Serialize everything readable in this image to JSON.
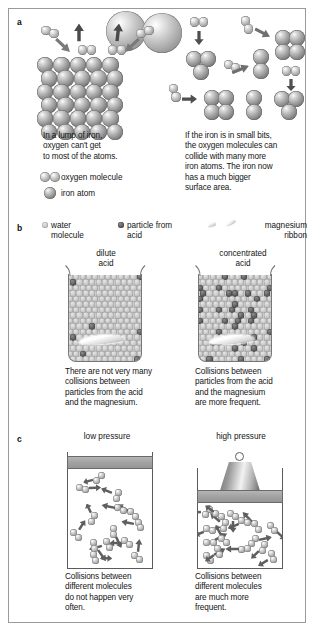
{
  "figure": {
    "background": "#ffffff",
    "border_color": "#9a9a9a"
  },
  "panels": [
    {
      "id": "a",
      "letter": "a",
      "topic": "surface area",
      "left": {
        "caption": "In a lump of iron, oxygen can't get to most of the atoms.",
        "caption_lines": [
          "In a lump of iron,",
          "oxygen can't get",
          "to most of the atoms."
        ]
      },
      "right": {
        "caption": "If the iron is in small bits, the oxygen molecules can collide with many more iron atoms. The iron now has a much bigger surface area.",
        "caption_lines": [
          "If the iron is in small bits,",
          "the oxygen molecules can",
          "collide with many more",
          "iron atoms. The iron now",
          "has a much bigger",
          "surface area."
        ]
      },
      "key": [
        {
          "swatch": "oxygen-molecule-icon",
          "label": "oxygen molecule"
        },
        {
          "swatch": "iron-atom-icon",
          "label": "iron atom"
        }
      ]
    },
    {
      "id": "b",
      "letter": "b",
      "topic": "concentration",
      "key": [
        {
          "swatch": "water-molecule-icon",
          "label_lines": [
            "water",
            "molecule"
          ],
          "label": "water molecule",
          "color": "#c6c6c6"
        },
        {
          "swatch": "acid-particle-icon",
          "label_lines": [
            "particle from",
            "acid"
          ],
          "label": "particle from acid",
          "color": "#4a4a4a"
        },
        {
          "swatch": "magnesium-ribbon-icon",
          "label_lines": [
            "magnesium",
            "ribbon"
          ],
          "label": "magnesium ribbon",
          "color": "#f0f0f0"
        }
      ],
      "left": {
        "heading_lines": [
          "dilute",
          "acid"
        ],
        "heading": "dilute acid",
        "caption": "There are not very many collisions between particles from the acid and the magnesium.",
        "caption_lines": [
          "There are not very many",
          "collisions between",
          "particles from the acid",
          "and the magnesium."
        ]
      },
      "right": {
        "heading_lines": [
          "concentrated",
          "acid"
        ],
        "heading": "concentrated acid",
        "caption": "Collisions between particles from the acid and the magnesium are more frequent.",
        "caption_lines": [
          "Collisions between",
          "particles from the acid",
          "and the magnesium",
          "are more frequent."
        ]
      }
    },
    {
      "id": "c",
      "letter": "c",
      "topic": "pressure",
      "left": {
        "heading": "low pressure",
        "caption": "Collisions between different molecules do not happen very often.",
        "caption_lines": [
          "Collisions between",
          "different molecules",
          "do not happen very",
          "often."
        ]
      },
      "right": {
        "heading": "high pressure",
        "caption": "Collisions between different molecules are much more frequent.",
        "caption_lines": [
          "Collisions between",
          "different molecules",
          "are much more",
          "frequent."
        ]
      }
    }
  ],
  "colors": {
    "atom_light": "#c8c8c8",
    "atom_dark": "#6a6a6a",
    "acid_particle": "#4a4a4a",
    "piston_grey": "#a2a2a2",
    "outline": "#5b5b5b"
  }
}
